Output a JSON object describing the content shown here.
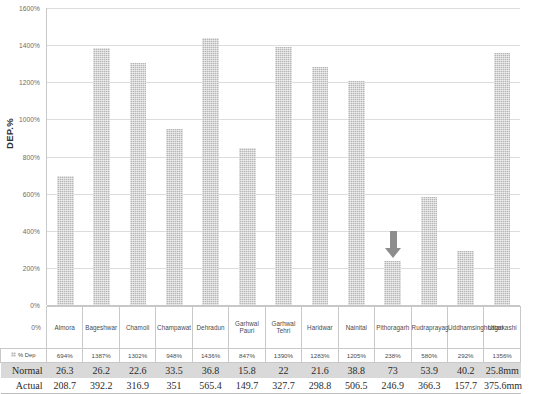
{
  "chart_data": {
    "type": "bar",
    "title": "",
    "xlabel": "",
    "ylabel": "DEP.%",
    "ylim": [
      0,
      1600
    ],
    "ytick_labels": [
      "1600%",
      "1400%",
      "1200%",
      "1000%",
      "800%",
      "600%",
      "400%",
      "200%",
      "0%"
    ],
    "ytick_values": [
      1600,
      1400,
      1200,
      1000,
      800,
      600,
      400,
      200,
      0
    ],
    "grid": true,
    "legend": "",
    "categories": [
      "Almora",
      "Bageshwar",
      "Chamoli",
      "Champawat",
      "Dehradun",
      "Garhwal Pauri",
      "Garhwal Tehri",
      "Haridwar",
      "Nainital",
      "Pithoragarh",
      "Rudraprayag",
      "Uddhamsinghnagar",
      "Uttarkashi"
    ],
    "series": [
      {
        "name": "% Dep",
        "values": [
          694,
          1387,
          1302,
          948,
          1436,
          847,
          1390,
          1283,
          1205,
          238,
          580,
          292,
          1356
        ]
      }
    ],
    "annotations": [
      {
        "type": "arrow",
        "direction": "down",
        "target_category": "Pithoragarh",
        "color": "#8d8d8d"
      }
    ]
  },
  "axis": {
    "y_title": "DEP.%",
    "ticks": [
      "1600%",
      "1400%",
      "1200%",
      "1000%",
      "800%",
      "600%",
      "400%",
      "200%",
      "0%"
    ]
  },
  "table": {
    "row_labels": {
      "dep": "% Dep",
      "normal": "Normal",
      "actual": "Actual"
    },
    "columns": [
      "Almora",
      "Bageshwar",
      "Chamoli",
      "Champawat",
      "Dehradun",
      "Garhwal Pauri",
      "Garhwal Tehri",
      "Haridwar",
      "Nainital",
      "Pithoragarh",
      "Rudraprayag",
      "Uddhamsinghnagar",
      "Uttarkashi"
    ],
    "rows": {
      "dep": [
        "694%",
        "1387%",
        "1302%",
        "948%",
        "1436%",
        "847%",
        "1390%",
        "1283%",
        "1205%",
        "238%",
        "580%",
        "292%",
        "1356%"
      ],
      "normal": [
        "26.3",
        "26.2",
        "22.6",
        "33.5",
        "36.8",
        "15.8",
        "22",
        "21.6",
        "38.8",
        "73",
        "53.9",
        "40.2",
        "25.8mm"
      ],
      "actual": [
        "208.7",
        "392.2",
        "316.9",
        "351",
        "565.4",
        "149.7",
        "327.7",
        "298.8",
        "506.5",
        "246.9",
        "366.3",
        "157.7",
        "375.6mm"
      ]
    }
  },
  "colors": {
    "bar_fill": "#b6b6b6",
    "gridline": "#dcdcdc",
    "axis": "#c9c9c9",
    "arrow": "#8d8d8d",
    "normal_row_bg": "#d9d9d9"
  }
}
